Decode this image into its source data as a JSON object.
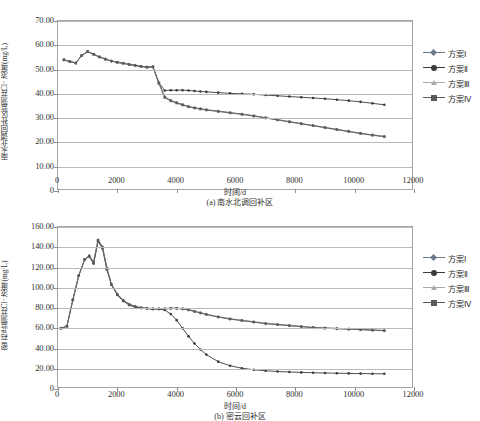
{
  "figure": {
    "panels": [
      {
        "id": "a",
        "caption": "(a) 南水北调回补区",
        "ylabel": "南水北调回补区监测井Cl⁻浓度/(mg/L)",
        "xlabel": "时间/d"
      },
      {
        "id": "b",
        "caption": "(b) 密云回补区",
        "ylabel": "密云2#监测井Cl⁻浓度/(mg/L)",
        "xlabel": "时间/d"
      }
    ]
  },
  "legend": {
    "items": [
      {
        "label": "方案Ⅰ",
        "color": "#6b7b8c",
        "marker": "diamond"
      },
      {
        "label": "方案Ⅱ",
        "color": "#3b3b3b",
        "marker": "circle"
      },
      {
        "label": "方案Ⅲ",
        "color": "#a9a9a9",
        "marker": "triangle"
      },
      {
        "label": "方案Ⅳ",
        "color": "#5a5a5a",
        "marker": "square"
      }
    ]
  },
  "chart_data": [
    {
      "type": "line",
      "id": "panel-a",
      "title": "(a) 南水北调回补区",
      "xlabel": "时间/d",
      "ylabel": "南水北调回补区监测井Cl⁻浓度/(mg/L)",
      "xlim": [
        0,
        12000
      ],
      "ylim": [
        0,
        70
      ],
      "xticks": [
        0,
        2000,
        4000,
        6000,
        8000,
        10000,
        12000
      ],
      "yticks": [
        "0",
        "10.00",
        "20.00",
        "30.00",
        "40.00",
        "50.00",
        "60.00",
        "70.00"
      ],
      "grid": true,
      "legend_position": "right",
      "x": [
        200,
        400,
        600,
        800,
        1000,
        1200,
        1400,
        1600,
        1800,
        2000,
        2200,
        2400,
        2600,
        2800,
        3000,
        3200,
        3400,
        3600,
        3800,
        4000,
        4200,
        4400,
        4600,
        4800,
        5000,
        5400,
        5800,
        6200,
        6600,
        7000,
        7400,
        7800,
        8200,
        8600,
        9000,
        9400,
        9800,
        10200,
        10600,
        11000
      ],
      "series": [
        {
          "name": "方案Ⅰ",
          "color": "#6b7b8c",
          "values": [
            54.0,
            53.3,
            52.7,
            55.8,
            57.4,
            56.3,
            55.2,
            54.3,
            53.5,
            53.0,
            52.6,
            52.1,
            51.7,
            51.3,
            51.0,
            51.1,
            44.6,
            38.8,
            37.3,
            36.4,
            35.6,
            34.8,
            34.3,
            33.9,
            33.5,
            32.9,
            32.3,
            31.7,
            31.0,
            30.2,
            29.4,
            28.6,
            27.8,
            27.0,
            26.2,
            25.4,
            24.6,
            23.8,
            23.1,
            22.5
          ]
        },
        {
          "name": "方案Ⅱ",
          "color": "#3b3b3b",
          "values": [
            54.0,
            53.3,
            52.7,
            55.8,
            57.4,
            56.3,
            55.2,
            54.3,
            53.5,
            53.0,
            52.6,
            52.1,
            51.7,
            51.3,
            51.0,
            51.1,
            44.6,
            41.4,
            41.5,
            41.5,
            41.5,
            41.4,
            41.2,
            41.0,
            40.8,
            40.5,
            40.2,
            40.0,
            39.8,
            39.5,
            39.2,
            38.9,
            38.6,
            38.3,
            38.0,
            37.6,
            37.2,
            36.7,
            36.1,
            35.5
          ]
        },
        {
          "name": "方案Ⅲ",
          "color": "#a9a9a9",
          "values": [
            54.0,
            53.3,
            52.7,
            55.8,
            57.4,
            56.3,
            55.2,
            54.3,
            53.5,
            53.0,
            52.6,
            52.1,
            51.7,
            51.3,
            51.0,
            51.1,
            44.2,
            38.4,
            37.0,
            36.1,
            35.3,
            34.6,
            34.1,
            33.7,
            33.3,
            32.7,
            32.1,
            31.5,
            30.8,
            30.0,
            29.2,
            28.4,
            27.6,
            26.8,
            26.0,
            25.2,
            24.4,
            23.6,
            22.9,
            22.3
          ]
        },
        {
          "name": "方案Ⅳ",
          "color": "#5a5a5a",
          "values": [
            54.0,
            53.3,
            52.7,
            55.8,
            57.4,
            56.3,
            55.2,
            54.3,
            53.5,
            53.0,
            52.6,
            52.1,
            51.7,
            51.3,
            51.0,
            51.1,
            44.4,
            38.6,
            37.2,
            36.3,
            35.5,
            34.7,
            34.2,
            33.8,
            33.4,
            32.8,
            32.2,
            31.6,
            30.9,
            30.1,
            29.3,
            28.5,
            27.7,
            26.9,
            26.1,
            25.3,
            24.5,
            23.7,
            23.0,
            22.4
          ]
        }
      ]
    },
    {
      "type": "line",
      "id": "panel-b",
      "title": "(b) 密云回补区",
      "xlabel": "时间/d",
      "ylabel": "密云2#监测井Cl⁻浓度/(mg/L)",
      "xlim": [
        0,
        12000
      ],
      "ylim": [
        0,
        160
      ],
      "xticks": [
        0,
        2000,
        4000,
        6000,
        8000,
        10000,
        12000
      ],
      "yticks": [
        "0",
        "20.00",
        "40.00",
        "60.00",
        "80.00",
        "100.00",
        "120.00",
        "140.00",
        "160.00"
      ],
      "grid": true,
      "legend_position": "right",
      "x": [
        100,
        300,
        500,
        700,
        900,
        1050,
        1200,
        1350,
        1500,
        1650,
        1800,
        2000,
        2200,
        2400,
        2600,
        2800,
        3000,
        3200,
        3400,
        3600,
        3800,
        4000,
        4200,
        4400,
        4600,
        4800,
        5000,
        5400,
        5800,
        6200,
        6600,
        7000,
        7400,
        7800,
        8200,
        8600,
        9000,
        9400,
        9800,
        10200,
        10600,
        11000
      ],
      "series": [
        {
          "name": "方案Ⅰ",
          "color": "#6b7b8c",
          "values": [
            60.0,
            62.0,
            88.0,
            112.0,
            128.0,
            131.0,
            124.0,
            146.0,
            139.0,
            118.0,
            103.0,
            93.0,
            87.0,
            83.0,
            81.0,
            80.0,
            79.5,
            79.0,
            79.0,
            79.0,
            79.5,
            79.5,
            79.0,
            78.0,
            76.5,
            75.0,
            73.5,
            71.0,
            69.0,
            67.5,
            66.0,
            64.5,
            63.5,
            62.5,
            61.5,
            60.5,
            60.0,
            59.5,
            59.0,
            58.5,
            58.0,
            57.5
          ]
        },
        {
          "name": "方案Ⅱ",
          "color": "#3b3b3b",
          "values": [
            60.0,
            62.0,
            88.0,
            112.0,
            128.0,
            131.0,
            124.0,
            146.0,
            139.0,
            118.0,
            103.0,
            93.0,
            87.0,
            83.0,
            81.0,
            80.0,
            79.5,
            79.0,
            79.0,
            78.0,
            74.0,
            68.0,
            60.0,
            52.0,
            45.0,
            39.0,
            34.0,
            27.0,
            23.0,
            20.5,
            19.0,
            18.0,
            17.3,
            16.8,
            16.4,
            16.1,
            15.8,
            15.6,
            15.4,
            15.2,
            15.1,
            15.0
          ]
        },
        {
          "name": "方案Ⅲ",
          "color": "#a9a9a9",
          "values": [
            60.0,
            62.0,
            88.0,
            112.0,
            128.0,
            132.0,
            126.0,
            148.0,
            141.0,
            120.0,
            104.0,
            94.0,
            88.0,
            84.0,
            82.0,
            80.5,
            80.0,
            79.5,
            79.5,
            79.5,
            80.0,
            80.0,
            79.5,
            78.5,
            77.0,
            75.5,
            74.0,
            71.5,
            69.5,
            68.0,
            66.5,
            65.0,
            64.0,
            63.0,
            62.0,
            61.0,
            60.5,
            60.0,
            59.5,
            59.0,
            58.5,
            58.0
          ]
        },
        {
          "name": "方案Ⅳ",
          "color": "#5a5a5a",
          "values": [
            60.0,
            62.0,
            88.0,
            112.0,
            128.0,
            131.5,
            125.0,
            147.0,
            140.0,
            119.0,
            103.5,
            93.5,
            87.5,
            83.5,
            81.5,
            80.2,
            79.7,
            79.2,
            79.2,
            79.2,
            79.7,
            79.7,
            79.2,
            78.2,
            76.7,
            75.2,
            73.7,
            71.2,
            69.2,
            67.7,
            66.2,
            64.7,
            63.7,
            62.7,
            61.7,
            60.7,
            60.2,
            59.7,
            59.2,
            58.7,
            58.2,
            57.7
          ]
        }
      ]
    }
  ]
}
